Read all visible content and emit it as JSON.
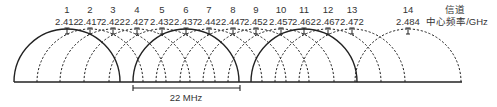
{
  "diagram": {
    "title_hint": "2.4 GHz Wi-Fi channel overlap",
    "header": {
      "channel_label": "信道",
      "frequency_label": "中心频率/GHz"
    },
    "channels": [
      {
        "number": "1",
        "freq": "2.412",
        "x": 67,
        "solid": true
      },
      {
        "number": "2",
        "freq": "2.417",
        "x": 90,
        "solid": false
      },
      {
        "number": "3",
        "freq": "2.422",
        "x": 113,
        "solid": false
      },
      {
        "number": "4",
        "freq": "2.427",
        "x": 137,
        "solid": false
      },
      {
        "number": "5",
        "freq": "2.432",
        "x": 162,
        "solid": false
      },
      {
        "number": "6",
        "freq": "2.437",
        "x": 186,
        "solid": true
      },
      {
        "number": "7",
        "freq": "2.442",
        "x": 209,
        "solid": false
      },
      {
        "number": "8",
        "freq": "2.447",
        "x": 233,
        "solid": false
      },
      {
        "number": "9",
        "freq": "2.452",
        "x": 256,
        "solid": false
      },
      {
        "number": "10",
        "freq": "2.457",
        "x": 281,
        "solid": false
      },
      {
        "number": "11",
        "freq": "2.462",
        "x": 304,
        "solid": true
      },
      {
        "number": "12",
        "freq": "2.467",
        "x": 328,
        "solid": false
      },
      {
        "number": "13",
        "freq": "2.472",
        "x": 352,
        "solid": false
      },
      {
        "number": "14",
        "freq": "2.484",
        "x": 408,
        "solid": false
      }
    ],
    "bandwidth_label": "22 MHz",
    "colors": {
      "line": "#222222",
      "text": "#333333",
      "background": "#ffffff"
    }
  }
}
